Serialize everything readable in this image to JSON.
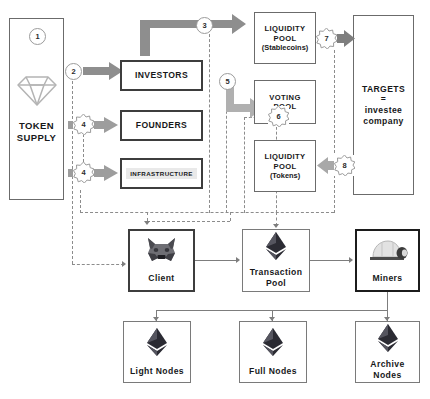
{
  "diagram": {
    "colors": {
      "box_border": "#6b6b6b",
      "dark_border": "#1c1c1c",
      "arrow_dark": "#6e6e6e",
      "arrow_light": "#b8b8b8",
      "dashed_line": "#8c8c8c",
      "text": "#17181a",
      "diamond": "#b4b4b4",
      "eth_dark": "#2b2b33",
      "eth_light": "#7f8089"
    },
    "nodes": {
      "token_supply": {
        "label_line1": "TOKEN",
        "label_line2": "SUPPLY",
        "icon": "diamond-icon"
      },
      "investors": {
        "label": "INVESTORS"
      },
      "founders": {
        "label": "FOUNDERS"
      },
      "infrastructure": {
        "label": "INFRASTRUCTURE"
      },
      "liquidity_pool_stablecoins": {
        "label_line1": "LIQUIDITY",
        "label_line2": "POOL",
        "label_line3": "(Stablecoins)"
      },
      "voting_pool": {
        "label_line1": "VOTING",
        "label_line2": "POOL"
      },
      "liquidity_pool_tokens": {
        "label_line1": "LIQUIDITY",
        "label_line2": "POOL",
        "label_line3": "(Tokens)"
      },
      "targets": {
        "label_line1": "TARGETS",
        "label_line2": "=",
        "label_line3": "investee",
        "label_line4": "company"
      },
      "client": {
        "label": "Client",
        "icon": "metamask-fox-icon"
      },
      "transaction_pool": {
        "label_line1": "Transaction",
        "label_line2": "Pool",
        "icon": "ethereum-icon"
      },
      "miners": {
        "label": "Miners",
        "icon": "mining-helmet-icon"
      },
      "light_nodes": {
        "label": "Light Nodes",
        "icon": "ethereum-icon"
      },
      "full_nodes": {
        "label": "Full Nodes",
        "icon": "ethereum-icon"
      },
      "archive_nodes": {
        "label_line1": "Archive",
        "label_line2": "Nodes",
        "icon": "ethereum-icon"
      }
    },
    "step_badges": [
      {
        "id": "step-1",
        "number": "1",
        "shape": "circle"
      },
      {
        "id": "step-2",
        "number": "2",
        "shape": "circle"
      },
      {
        "id": "step-3",
        "number": "3",
        "shape": "starburst"
      },
      {
        "id": "step-4a",
        "number": "4",
        "shape": "starburst"
      },
      {
        "id": "step-4b",
        "number": "4",
        "shape": "starburst"
      },
      {
        "id": "step-5",
        "number": "5",
        "shape": "circle"
      },
      {
        "id": "step-6",
        "number": "6",
        "shape": "starburst"
      },
      {
        "id": "step-7",
        "number": "7",
        "shape": "starburst"
      },
      {
        "id": "step-8",
        "number": "8",
        "shape": "starburst"
      }
    ]
  }
}
